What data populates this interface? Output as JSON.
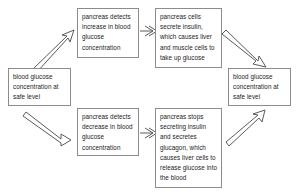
{
  "diagram": {
    "background_color": "#ffffff",
    "box_border_color": "#8c8c8c",
    "arrow_color": "#5a5a5a",
    "text_color": "#1a1a1a",
    "nodes": [
      {
        "id": "safe-left",
        "text": "blood glucose concentration at safe level"
      },
      {
        "id": "detect-increase",
        "text": "pancreas detects increase in blood glucose concentration"
      },
      {
        "id": "secrete-insulin",
        "text": "pancreas cells secrete insulin, which causes liver and muscle cells to take up glucose"
      },
      {
        "id": "safe-right",
        "text": "blood glucose concentration at safe level"
      },
      {
        "id": "detect-decrease",
        "text": "pancreas detects decrease in blood glucose concentration"
      },
      {
        "id": "stop-insulin",
        "text": "pancreas stops secreting insulin and secretes glucagon, which causes liver cells to release glucose into the blood"
      }
    ],
    "arrows": [
      {
        "id": "arrow-safe-left-to-detect-increase",
        "from": "safe-left",
        "to": "detect-increase",
        "style": "diagonal-up-right"
      },
      {
        "id": "arrow-detect-increase-to-secrete",
        "from": "detect-increase",
        "to": "secrete-insulin",
        "style": "horizontal-right"
      },
      {
        "id": "arrow-secrete-to-safe-right",
        "from": "secrete-insulin",
        "to": "safe-right",
        "style": "diagonal-down-right"
      },
      {
        "id": "arrow-safe-left-to-detect-decrease",
        "from": "safe-left",
        "to": "detect-decrease",
        "style": "diagonal-down-right"
      },
      {
        "id": "arrow-detect-decrease-to-stop",
        "from": "detect-decrease",
        "to": "stop-insulin",
        "style": "horizontal-right"
      },
      {
        "id": "arrow-stop-to-safe-right",
        "from": "stop-insulin",
        "to": "safe-right",
        "style": "diagonal-up-right"
      }
    ]
  }
}
